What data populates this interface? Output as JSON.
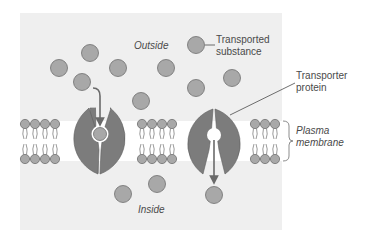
{
  "diagram": {
    "region_labels": {
      "outside": "Outside",
      "inside": "Inside"
    },
    "callouts": {
      "transported_substance": [
        "Transported",
        "substance"
      ],
      "transporter_protein": [
        "Transporter",
        "protein"
      ],
      "plasma_membrane": [
        "Plasma",
        "membrane"
      ]
    },
    "colors": {
      "panel_bg": "#efefef",
      "molecule_fill": "#a8a8a8",
      "molecule_stroke": "#6e6e6e",
      "protein_fill": "#7c7c7c",
      "arrow": "#6a6a6a",
      "text": "#4a4a4a"
    },
    "elements": {
      "outside_molecules": 9,
      "inside_molecules": 3,
      "transporter_proteins": 2
    }
  }
}
